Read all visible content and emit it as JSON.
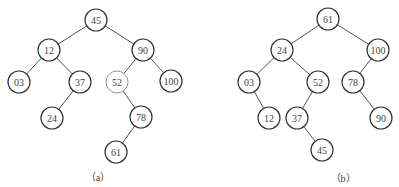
{
  "figures": [
    {
      "id": "a",
      "caption": "（a）",
      "caption_pos": [
        98,
        181
      ],
      "nodes": [
        {
          "key": "45",
          "label": "45",
          "x": 96,
          "y": 20
        },
        {
          "key": "12",
          "label": "12",
          "x": 49,
          "y": 50
        },
        {
          "key": "90",
          "label": "90",
          "x": 143,
          "y": 50
        },
        {
          "key": "03",
          "label": "03",
          "x": 19,
          "y": 82
        },
        {
          "key": "37",
          "label": "37",
          "x": 80,
          "y": 82
        },
        {
          "key": "52",
          "label": "52",
          "x": 117,
          "y": 82,
          "light": true
        },
        {
          "key": "100",
          "label": "100",
          "x": 171,
          "y": 81
        },
        {
          "key": "24",
          "label": "24",
          "x": 52,
          "y": 118
        },
        {
          "key": "78",
          "label": "78",
          "x": 141,
          "y": 117
        },
        {
          "key": "61",
          "label": "61",
          "x": 116,
          "y": 152
        }
      ],
      "edges": [
        [
          "45",
          "12"
        ],
        [
          "45",
          "90"
        ],
        [
          "12",
          "03"
        ],
        [
          "12",
          "37"
        ],
        [
          "90",
          "52"
        ],
        [
          "90",
          "100"
        ],
        [
          "37",
          "24"
        ],
        [
          "52",
          "78"
        ],
        [
          "78",
          "61"
        ]
      ]
    },
    {
      "id": "b",
      "caption": "（b）",
      "caption_pos": [
        343,
        182
      ],
      "nodes": [
        {
          "key": "61",
          "label": "61",
          "x": 328,
          "y": 19
        },
        {
          "key": "24",
          "label": "24",
          "x": 282,
          "y": 50
        },
        {
          "key": "100",
          "label": "100",
          "x": 378,
          "y": 50
        },
        {
          "key": "03",
          "label": "03",
          "x": 249,
          "y": 82
        },
        {
          "key": "52",
          "label": "52",
          "x": 318,
          "y": 82
        },
        {
          "key": "78",
          "label": "78",
          "x": 353,
          "y": 82
        },
        {
          "key": "12",
          "label": "12",
          "x": 269,
          "y": 118
        },
        {
          "key": "37",
          "label": "37",
          "x": 297,
          "y": 118
        },
        {
          "key": "90",
          "label": "90",
          "x": 381,
          "y": 118
        },
        {
          "key": "45",
          "label": "45",
          "x": 322,
          "y": 150
        }
      ],
      "edges": [
        [
          "61",
          "24"
        ],
        [
          "61",
          "100"
        ],
        [
          "24",
          "03"
        ],
        [
          "24",
          "52"
        ],
        [
          "100",
          "78"
        ],
        [
          "03",
          "12"
        ],
        [
          "52",
          "37"
        ],
        [
          "78",
          "90"
        ],
        [
          "37",
          "45"
        ]
      ]
    }
  ],
  "node_radius": 11
}
